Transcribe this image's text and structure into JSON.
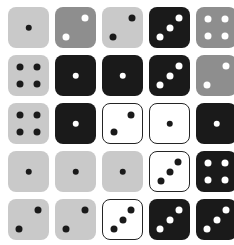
{
  "image": {
    "title": "Dice grid",
    "description": "A 5 by 5 grid of square dice faces in varied tones",
    "rows": 5,
    "columns": 5,
    "background_color": "#ffffff"
  },
  "palette": {
    "light_gray": "#c9c9c9",
    "medium_gray": "#8e8e8e",
    "black": "#1a1a1a",
    "white": "#ffffff",
    "dark_pip": "#1a1a1a",
    "light_pip": "#ffffff",
    "border": "#242424"
  },
  "pip_layouts": {
    "1": [
      [
        50,
        50
      ]
    ],
    "2": [
      [
        72,
        28
      ],
      [
        28,
        72
      ]
    ],
    "3": [
      [
        72,
        26
      ],
      [
        50,
        50
      ],
      [
        28,
        74
      ]
    ],
    "4": [
      [
        30,
        30
      ],
      [
        70,
        30
      ],
      [
        30,
        70
      ],
      [
        70,
        70
      ]
    ]
  },
  "dice": [
    {
      "row": 1,
      "col": 1,
      "name": "die-r1c1",
      "face": 1,
      "face_label": "1",
      "body_color": "#c9c9c9",
      "pip_color": "#1a1a1a",
      "style": "light-gray",
      "bordered": false
    },
    {
      "row": 1,
      "col": 2,
      "name": "die-r1c2",
      "face": 2,
      "face_label": "2",
      "body_color": "#8e8e8e",
      "pip_color": "#ffffff",
      "style": "medium-gray",
      "bordered": false
    },
    {
      "row": 1,
      "col": 3,
      "name": "die-r1c3",
      "face": 2,
      "face_label": "2",
      "body_color": "#c9c9c9",
      "pip_color": "#1a1a1a",
      "style": "light-gray",
      "bordered": false
    },
    {
      "row": 1,
      "col": 4,
      "name": "die-r1c4",
      "face": 3,
      "face_label": "3",
      "body_color": "#1a1a1a",
      "pip_color": "#ffffff",
      "style": "black",
      "bordered": false
    },
    {
      "row": 1,
      "col": 5,
      "name": "die-r1c5",
      "face": 4,
      "face_label": "4",
      "body_color": "#8e8e8e",
      "pip_color": "#ffffff",
      "style": "medium-gray",
      "bordered": false
    },
    {
      "row": 2,
      "col": 1,
      "name": "die-r2c1",
      "face": 4,
      "face_label": "4",
      "body_color": "#c9c9c9",
      "pip_color": "#1a1a1a",
      "style": "light-gray",
      "bordered": false
    },
    {
      "row": 2,
      "col": 2,
      "name": "die-r2c2",
      "face": 1,
      "face_label": "1",
      "body_color": "#1a1a1a",
      "pip_color": "#ffffff",
      "style": "black",
      "bordered": false
    },
    {
      "row": 2,
      "col": 3,
      "name": "die-r2c3",
      "face": 1,
      "face_label": "1",
      "body_color": "#1a1a1a",
      "pip_color": "#ffffff",
      "style": "black",
      "bordered": false
    },
    {
      "row": 2,
      "col": 4,
      "name": "die-r2c4",
      "face": 3,
      "face_label": "3",
      "body_color": "#1a1a1a",
      "pip_color": "#ffffff",
      "style": "black",
      "bordered": false
    },
    {
      "row": 2,
      "col": 5,
      "name": "die-r2c5",
      "face": 2,
      "face_label": "2",
      "body_color": "#8e8e8e",
      "pip_color": "#ffffff",
      "style": "medium-gray",
      "bordered": false
    },
    {
      "row": 3,
      "col": 1,
      "name": "die-r3c1",
      "face": 4,
      "face_label": "4",
      "body_color": "#c9c9c9",
      "pip_color": "#1a1a1a",
      "style": "light-gray",
      "bordered": false
    },
    {
      "row": 3,
      "col": 2,
      "name": "die-r3c2",
      "face": 1,
      "face_label": "1",
      "body_color": "#1a1a1a",
      "pip_color": "#ffffff",
      "style": "black",
      "bordered": false
    },
    {
      "row": 3,
      "col": 3,
      "name": "die-r3c3",
      "face": 2,
      "face_label": "2",
      "body_color": "#ffffff",
      "pip_color": "#1a1a1a",
      "style": "white",
      "bordered": true
    },
    {
      "row": 3,
      "col": 4,
      "name": "die-r3c4",
      "face": 1,
      "face_label": "1",
      "body_color": "#ffffff",
      "pip_color": "#1a1a1a",
      "style": "white",
      "bordered": true
    },
    {
      "row": 3,
      "col": 5,
      "name": "die-r3c5",
      "face": 1,
      "face_label": "1",
      "body_color": "#1a1a1a",
      "pip_color": "#ffffff",
      "style": "black",
      "bordered": false
    },
    {
      "row": 4,
      "col": 1,
      "name": "die-r4c1",
      "face": 1,
      "face_label": "1",
      "body_color": "#c9c9c9",
      "pip_color": "#1a1a1a",
      "style": "light-gray",
      "bordered": false
    },
    {
      "row": 4,
      "col": 2,
      "name": "die-r4c2",
      "face": 1,
      "face_label": "1",
      "body_color": "#c9c9c9",
      "pip_color": "#1a1a1a",
      "style": "light-gray",
      "bordered": false
    },
    {
      "row": 4,
      "col": 3,
      "name": "die-r4c3",
      "face": 1,
      "face_label": "1",
      "body_color": "#c9c9c9",
      "pip_color": "#1a1a1a",
      "style": "light-gray",
      "bordered": false
    },
    {
      "row": 4,
      "col": 4,
      "name": "die-r4c4",
      "face": 3,
      "face_label": "3",
      "body_color": "#ffffff",
      "pip_color": "#1a1a1a",
      "style": "white",
      "bordered": true
    },
    {
      "row": 4,
      "col": 5,
      "name": "die-r4c5",
      "face": 4,
      "face_label": "4",
      "body_color": "#1a1a1a",
      "pip_color": "#ffffff",
      "style": "black",
      "bordered": false
    },
    {
      "row": 5,
      "col": 1,
      "name": "die-r5c1",
      "face": 2,
      "face_label": "2",
      "body_color": "#c9c9c9",
      "pip_color": "#1a1a1a",
      "style": "light-gray",
      "bordered": false
    },
    {
      "row": 5,
      "col": 2,
      "name": "die-r5c2",
      "face": 2,
      "face_label": "2",
      "body_color": "#c9c9c9",
      "pip_color": "#1a1a1a",
      "style": "light-gray",
      "bordered": false
    },
    {
      "row": 5,
      "col": 3,
      "name": "die-r5c3",
      "face": 3,
      "face_label": "3",
      "body_color": "#ffffff",
      "pip_color": "#1a1a1a",
      "style": "white",
      "bordered": true
    },
    {
      "row": 5,
      "col": 4,
      "name": "die-r5c4",
      "face": 3,
      "face_label": "3",
      "body_color": "#1a1a1a",
      "pip_color": "#ffffff",
      "style": "black",
      "bordered": false
    },
    {
      "row": 5,
      "col": 5,
      "name": "die-r5c5",
      "face": 3,
      "face_label": "3",
      "body_color": "#1a1a1a",
      "pip_color": "#ffffff",
      "style": "black",
      "bordered": false
    }
  ]
}
